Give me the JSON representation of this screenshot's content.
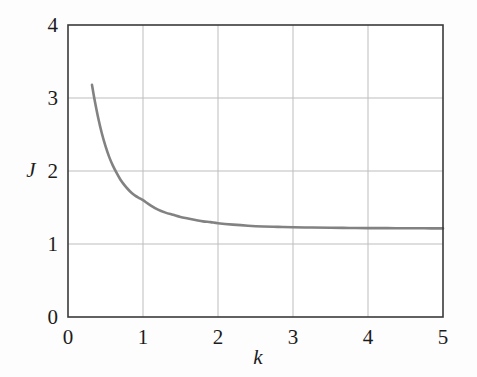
{
  "figure": {
    "background_color": "#fdfdfd",
    "plot_background_color": "#ffffff",
    "axis_color": "#3a3a3a",
    "grid_color": "#bdbdbd",
    "curve_color": "#828282",
    "text_color": "#1c1c1c"
  },
  "axes": {
    "x_title": "k",
    "y_title": "J",
    "x_ticks": [
      "0",
      "1",
      "2",
      "3",
      "4",
      "5"
    ],
    "y_ticks": [
      "0",
      "1",
      "2",
      "3",
      "4"
    ]
  },
  "chart_data": {
    "type": "line",
    "title": "",
    "xlabel": "k",
    "ylabel": "J",
    "xlim": [
      0,
      5
    ],
    "ylim": [
      0,
      4
    ],
    "xticks": [
      0,
      1,
      2,
      3,
      4,
      5
    ],
    "yticks": [
      0,
      1,
      2,
      3,
      4
    ],
    "grid": true,
    "legend": null,
    "series": [
      {
        "name": "J(k)",
        "color": "#828282",
        "linewidth": 2.6,
        "x": [
          0.32,
          0.35,
          0.4,
          0.45,
          0.5,
          0.55,
          0.6,
          0.65,
          0.7,
          0.75,
          0.8,
          0.85,
          0.9,
          0.95,
          1.0,
          1.1,
          1.2,
          1.3,
          1.4,
          1.5,
          1.6,
          1.7,
          1.8,
          1.9,
          2.0,
          2.2,
          2.4,
          2.6,
          2.8,
          3.0,
          3.25,
          3.5,
          3.75,
          4.0,
          4.25,
          4.5,
          4.75,
          5.0
        ],
        "y": [
          3.18,
          3.0,
          2.74,
          2.52,
          2.34,
          2.19,
          2.07,
          1.97,
          1.88,
          1.81,
          1.75,
          1.7,
          1.66,
          1.63,
          1.6,
          1.53,
          1.47,
          1.43,
          1.4,
          1.37,
          1.35,
          1.33,
          1.31,
          1.3,
          1.285,
          1.265,
          1.25,
          1.24,
          1.235,
          1.23,
          1.225,
          1.222,
          1.22,
          1.218,
          1.217,
          1.216,
          1.215,
          1.214
        ]
      }
    ],
    "asymptote": 1.21
  },
  "geometry": {
    "plot_left": 68,
    "plot_right": 443,
    "plot_top": 25,
    "plot_bottom": 317
  }
}
